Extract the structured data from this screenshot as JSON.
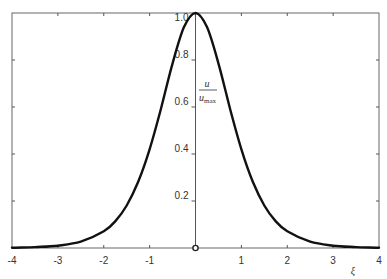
{
  "chart_data": {
    "type": "line",
    "title": "",
    "xlabel": "ξ",
    "ylabel": "u / u_max",
    "ylabel_parts": {
      "numerator": "u",
      "denominator_base": "u",
      "denominator_sub": "max"
    },
    "xlim": [
      -4,
      4
    ],
    "ylim": [
      0,
      1.0
    ],
    "grid": false,
    "legend": null,
    "x_ticks": [
      -4,
      -3,
      -2,
      -1,
      0,
      1,
      2,
      3,
      4
    ],
    "x_tick_labels": [
      "-4",
      "-3",
      "-2",
      "-1",
      "0",
      "1",
      "2",
      "3",
      "4"
    ],
    "y_ticks": [
      0.2,
      0.4,
      0.6,
      0.8,
      1.0
    ],
    "y_tick_labels": [
      "0.2",
      "0.4",
      "0.6",
      "0.8",
      "1.0"
    ],
    "series": [
      {
        "name": "u/u_max",
        "color": "#111111",
        "x": [
          -4,
          -3.5,
          -3,
          -2.5,
          -2,
          -1.75,
          -1.5,
          -1.25,
          -1,
          -0.75,
          -0.5,
          -0.25,
          0,
          0.25,
          0.5,
          0.75,
          1,
          1.25,
          1.5,
          1.75,
          2,
          2.5,
          3,
          3.5,
          4
        ],
        "y": [
          0.001,
          0.004,
          0.01,
          0.027,
          0.071,
          0.113,
          0.181,
          0.282,
          0.42,
          0.595,
          0.786,
          0.94,
          1.0,
          0.94,
          0.786,
          0.595,
          0.42,
          0.282,
          0.181,
          0.113,
          0.071,
          0.027,
          0.01,
          0.004,
          0.001
        ]
      }
    ],
    "annotations": [
      "origin marker circle at (0,0)"
    ]
  },
  "colors": {
    "curve": "#111111",
    "frame": "#555555",
    "text": "#333333",
    "background": "#ffffff"
  }
}
